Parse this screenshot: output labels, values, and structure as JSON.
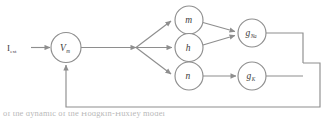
{
  "diagram": {
    "stroke_color": "#8e8e8e",
    "text_color": "#3b3b3b",
    "background_color": "#ffffff",
    "input": {
      "label_main": "I",
      "label_sub": "ext",
      "full_label": "I_ext"
    },
    "nodes": [
      {
        "id": "vm",
        "label_main": "V",
        "label_sub": "m",
        "full_label": "V_m"
      },
      {
        "id": "m",
        "label_main": "m",
        "label_sub": "",
        "full_label": "m"
      },
      {
        "id": "h",
        "label_main": "h",
        "label_sub": "",
        "full_label": "h"
      },
      {
        "id": "n",
        "label_main": "n",
        "label_sub": "",
        "full_label": "n"
      },
      {
        "id": "gna",
        "label_main": "g",
        "label_sub": "Na",
        "full_label": "g_Na"
      },
      {
        "id": "gk",
        "label_main": "g",
        "label_sub": "K",
        "full_label": "g_K"
      }
    ],
    "caption": "of the dynamic of the Hodgkin-Huxley model"
  }
}
